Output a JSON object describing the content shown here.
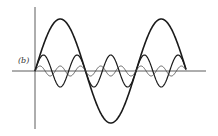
{
  "figure": {
    "label": "(b)",
    "axes": {
      "origin": [
        35,
        71
      ],
      "x_axis": {
        "from": 12,
        "to": 206
      },
      "y_axis": {
        "from": 7,
        "to": 129
      }
    },
    "waves": [
      {
        "name": "fundamental",
        "harmonic": 1,
        "amplitude": 52,
        "period": 101,
        "x_start": 35,
        "x_end": 186,
        "stroke_width": 1.6,
        "color": "#1a1a1a"
      },
      {
        "name": "third-harmonic",
        "harmonic": 3,
        "amplitude": 16,
        "period": 33.67,
        "x_start": 35,
        "x_end": 186,
        "stroke_width": 1.2,
        "color": "#1a1a1a"
      },
      {
        "name": "fifth-harmonic",
        "harmonic": 5,
        "amplitude": 5,
        "period": 20.2,
        "x_start": 35,
        "x_end": 186,
        "stroke_width": 0.8,
        "color": "#444444"
      }
    ]
  }
}
